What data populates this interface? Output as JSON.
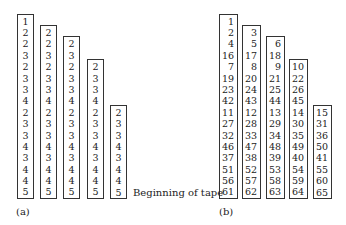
{
  "figure_a": {
    "caption": "(a)",
    "columns": [
      [
        1,
        2,
        2,
        3,
        2,
        3,
        3,
        4,
        2,
        3,
        3,
        4,
        3,
        4,
        4,
        5
      ],
      [
        2,
        2,
        3,
        2,
        3,
        3,
        4,
        2,
        3,
        3,
        4,
        3,
        4,
        4,
        5
      ],
      [
        2,
        3,
        2,
        3,
        3,
        4,
        2,
        3,
        3,
        4,
        3,
        4,
        4,
        5
      ],
      [
        2,
        3,
        3,
        4,
        2,
        3,
        3,
        4,
        3,
        4,
        4,
        5
      ],
      [
        2,
        3,
        3,
        4,
        3,
        4,
        4,
        5
      ]
    ]
  },
  "figure_b": {
    "caption": "(b)",
    "columns": [
      [
        1,
        2,
        4,
        16,
        7,
        19,
        23,
        42,
        11,
        27,
        32,
        46,
        37,
        51,
        56,
        61
      ],
      [
        3,
        5,
        17,
        8,
        20,
        24,
        43,
        12,
        28,
        33,
        47,
        38,
        52,
        57,
        62
      ],
      [
        6,
        18,
        9,
        21,
        25,
        44,
        13,
        29,
        34,
        48,
        39,
        53,
        58,
        63
      ],
      [
        10,
        22,
        26,
        45,
        14,
        30,
        35,
        49,
        40,
        54,
        59,
        64
      ],
      [
        15,
        31,
        36,
        50,
        41,
        55,
        60,
        65
      ]
    ]
  },
  "label": "Beginning of tape"
}
